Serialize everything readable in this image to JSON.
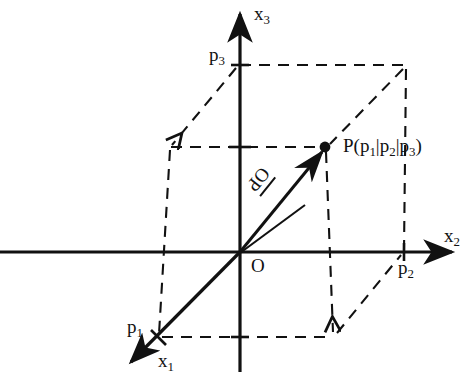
{
  "figure": {
    "background_color": "#ffffff",
    "stroke_color": "#111111",
    "width": 476,
    "height": 378
  },
  "axes": [
    {
      "id": "x1",
      "label": "x",
      "subscript": "1",
      "direction": "down-left",
      "arrow": true
    },
    {
      "id": "x2",
      "label": "x",
      "subscript": "2",
      "direction": "right",
      "arrow": true
    },
    {
      "id": "x3",
      "label": "x",
      "subscript": "3",
      "direction": "up",
      "arrow": true
    }
  ],
  "origin": {
    "label": "O"
  },
  "ticks": [
    {
      "id": "p1",
      "label": "p",
      "subscript": "1",
      "axis": "x1"
    },
    {
      "id": "p2",
      "label": "p",
      "subscript": "2",
      "axis": "x2"
    },
    {
      "id": "p3",
      "label": "p",
      "subscript": "3",
      "axis": "x3"
    }
  ],
  "point": {
    "name": "P",
    "open_paren": "P(p",
    "sub1": "1",
    "sep1": "|p",
    "sub2": "2",
    "sep2": "|p",
    "sub3": "3",
    "close_paren": ")",
    "full_label": "P(p1|p2|p3)"
  },
  "vector": {
    "label": "OP",
    "has_overarrow": true,
    "from": "O",
    "to": "P"
  },
  "construction": {
    "style": "dashed",
    "shape": "parallelepiped",
    "note": "dashed projection box from origin to point P"
  }
}
